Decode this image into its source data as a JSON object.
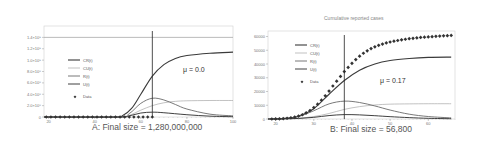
{
  "chart_data": [
    {
      "type": "line",
      "panel": "A",
      "title": "",
      "caption": "A: Final size = 1,280,000,000",
      "xlabel": "",
      "ylabel": "",
      "xlim": [
        18,
        100
      ],
      "ylim": [
        0,
        1600000000.0
      ],
      "x_ticks": [
        "20",
        "40",
        "60",
        "80",
        "100"
      ],
      "y_ticks": [
        "0",
        "2.0×10⁸",
        "4.0×10⁸",
        "6.0×10⁸",
        "8.0×10⁸",
        "1.0×10⁹",
        "1.2×10⁹",
        "1.4×10⁹"
      ],
      "annotation": "μ = 0.0",
      "vertical_line_x": 65,
      "horizontal_ref_y": 1400000000.0,
      "legend": [
        "CR(t)",
        "CU(t)",
        "R(t)",
        "U(t)",
        "Data"
      ],
      "legend_position": "left-middle",
      "grid": false,
      "series": [
        {
          "name": "CR(t)",
          "x": [
            18,
            48,
            52,
            56,
            60,
            65,
            70,
            75,
            80,
            90,
            100
          ],
          "values": [
            0,
            0,
            20000000.0,
            150000000.0,
            400000000.0,
            720000000.0,
            920000000.0,
            1030000000.0,
            1080000000.0,
            1120000000.0,
            1140000000.0
          ]
        },
        {
          "name": "CU(t)",
          "x": [
            18,
            50,
            55,
            60,
            65,
            70,
            75,
            80,
            90,
            100
          ],
          "values": [
            0,
            0,
            30000000.0,
            120000000.0,
            200000000.0,
            250000000.0,
            275000000.0,
            285000000.0,
            290000000.0,
            290000000.0
          ]
        },
        {
          "name": "R(t)",
          "x": [
            18,
            50,
            55,
            60,
            65,
            70,
            75,
            80,
            90,
            100
          ],
          "values": [
            0,
            0,
            60000000.0,
            240000000.0,
            330000000.0,
            300000000.0,
            220000000.0,
            140000000.0,
            50000000.0,
            20000000.0
          ]
        },
        {
          "name": "U(t)",
          "x": [
            18,
            50,
            55,
            60,
            65,
            70,
            80,
            90,
            100
          ],
          "values": [
            0,
            0,
            20000000.0,
            70000000.0,
            85000000.0,
            75000000.0,
            40000000.0,
            15000000.0,
            5000000.0
          ]
        },
        {
          "name": "Data",
          "x": [
            19,
            21,
            23,
            25,
            27,
            29,
            31,
            33,
            35,
            37,
            39,
            41,
            43,
            45,
            47,
            49,
            51,
            53,
            55,
            57,
            59,
            61,
            63,
            65
          ],
          "values": [
            0,
            0,
            0,
            0,
            0,
            0,
            0,
            0,
            0,
            0,
            0,
            0,
            0,
            0,
            0,
            0,
            0,
            0,
            0,
            0,
            0,
            0,
            0,
            0
          ]
        }
      ]
    },
    {
      "type": "line",
      "panel": "B",
      "title": "Cumulative reported cases",
      "caption": "B: Final size = 56,800",
      "xlabel": "",
      "ylabel": "",
      "xlim": [
        18,
        67
      ],
      "ylim": [
        0,
        64000
      ],
      "x_ticks": [
        "20",
        "30",
        "40",
        "50",
        "60"
      ],
      "y_ticks": [
        "0",
        "10000",
        "20000",
        "30000",
        "40000",
        "50000",
        "60000"
      ],
      "annotation": "μ = 0.17",
      "vertical_line_x": 38,
      "legend": [
        "CR(t)",
        "CU(t)",
        "R(t)",
        "U(t)",
        "Data"
      ],
      "legend_position": "left-upper",
      "grid": false,
      "series": [
        {
          "name": "CR(t)",
          "x": [
            18,
            22,
            26,
            30,
            34,
            38,
            42,
            46,
            50,
            55,
            60,
            66
          ],
          "values": [
            0,
            300,
            2000,
            7500,
            18000,
            28000,
            35500,
            40000,
            42500,
            44000,
            44800,
            45000
          ]
        },
        {
          "name": "CU(t)",
          "x": [
            18,
            22,
            26,
            30,
            34,
            38,
            42,
            46,
            50,
            55,
            60,
            66
          ],
          "values": [
            0,
            100,
            500,
            1800,
            4000,
            7000,
            9000,
            10200,
            10800,
            11000,
            11100,
            11100
          ]
        },
        {
          "name": "R(t)",
          "x": [
            18,
            22,
            26,
            30,
            34,
            38,
            42,
            46,
            50,
            55,
            60,
            66
          ],
          "values": [
            0,
            300,
            1800,
            6000,
            11000,
            13000,
            12000,
            9500,
            6500,
            3500,
            1800,
            800
          ]
        },
        {
          "name": "U(t)",
          "x": [
            18,
            22,
            26,
            30,
            34,
            38,
            42,
            46,
            50,
            55,
            60,
            66
          ],
          "values": [
            0,
            100,
            400,
            1200,
            2500,
            3200,
            3000,
            2400,
            1700,
            1000,
            500,
            200
          ]
        },
        {
          "name": "Data",
          "x": [
            19,
            20,
            21,
            22,
            23,
            24,
            25,
            26,
            27,
            28,
            29,
            30,
            31,
            32,
            33,
            34,
            35,
            36,
            37,
            38,
            39,
            40,
            41,
            42,
            43,
            44,
            45,
            46,
            47,
            48,
            49,
            50,
            51,
            52,
            53,
            54,
            55,
            56,
            57,
            58,
            59,
            60,
            61,
            62,
            63,
            64,
            65,
            66
          ],
          "values": [
            0,
            50,
            150,
            300,
            550,
            900,
            1400,
            2100,
            3100,
            4500,
            6200,
            8300,
            10800,
            13700,
            16900,
            20300,
            24000,
            27500,
            31000,
            34500,
            37500,
            40500,
            43200,
            45700,
            47800,
            49600,
            51200,
            52500,
            53600,
            54500,
            55300,
            56000,
            56600,
            57100,
            57600,
            58000,
            58400,
            58700,
            59000,
            59300,
            59500,
            59700,
            59900,
            60100,
            60300,
            60500,
            60600,
            60800
          ]
        }
      ]
    }
  ]
}
